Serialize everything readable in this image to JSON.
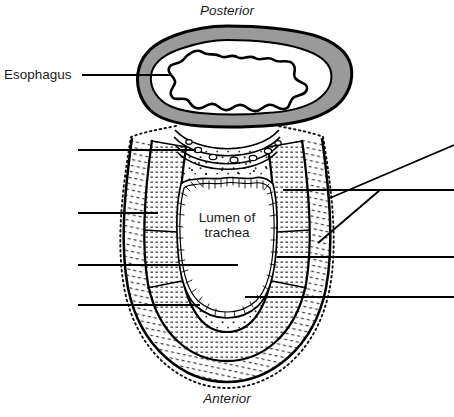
{
  "diagram": {
    "type": "histology-cross-section",
    "orientation_labels": {
      "top": "Posterior",
      "bottom": "Anterior"
    },
    "labels": [
      {
        "name": "esophagus",
        "text": "Esophagus",
        "leader": "horizontal-right"
      },
      {
        "name": "lumen-of-trachea",
        "text": "Lumen of\ntrachea",
        "line1": "Lumen of",
        "line2": "trachea"
      }
    ],
    "unlabeled_leader_lines": {
      "left_count": 4,
      "right_count": 4,
      "slanted_count": 2
    },
    "colors": {
      "outline": "#000000",
      "esophagus_muscle_gray": "#9a9a9a",
      "background": "#ffffff",
      "stipple": "#111111",
      "text": "#1a1a1a"
    },
    "structures": [
      "esophagus outer wall",
      "esophagus muscular layer",
      "esophagus lumen",
      "trachealis muscle",
      "tracheal cartilage",
      "perichondrium",
      "respiratory mucosa with cilia",
      "adventitia"
    ]
  }
}
